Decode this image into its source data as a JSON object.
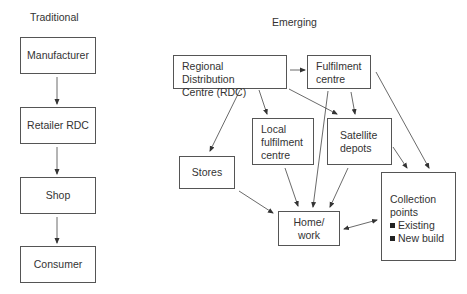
{
  "traditional": {
    "title": "Traditional",
    "boxes": [
      {
        "id": "manufacturer",
        "label": "Manufacturer"
      },
      {
        "id": "retailer-rdc",
        "label": "Retailer RDC"
      },
      {
        "id": "shop",
        "label": "Shop"
      },
      {
        "id": "consumer",
        "label": "Consumer"
      }
    ]
  },
  "emerging": {
    "title": "Emerging",
    "boxes": {
      "rdc": {
        "line1": "Regional Distribution",
        "line2": "Centre (RDC)"
      },
      "fulfilment": {
        "line1": "Fulfilment",
        "line2": "centre"
      },
      "local": {
        "line1": "Local",
        "line2": "fulfilment",
        "line3": "centre"
      },
      "satellite": {
        "line1": "Satellite",
        "line2": "depots"
      },
      "stores": {
        "label": "Stores"
      },
      "home": {
        "line1": "Home/",
        "line2": "work"
      },
      "collection": {
        "line1": "Collection",
        "line2": "points",
        "items": [
          "Existing",
          "New build"
        ]
      }
    },
    "edges": [
      {
        "from": "rdc",
        "to": "fulfilment"
      },
      {
        "from": "rdc",
        "to": "stores"
      },
      {
        "from": "rdc",
        "to": "local"
      },
      {
        "from": "rdc",
        "to": "satellite"
      },
      {
        "from": "fulfilment",
        "to": "satellite"
      },
      {
        "from": "fulfilment",
        "to": "home"
      },
      {
        "from": "fulfilment",
        "to": "collection"
      },
      {
        "from": "stores",
        "to": "home"
      },
      {
        "from": "local",
        "to": "home"
      },
      {
        "from": "satellite",
        "to": "home"
      },
      {
        "from": "satellite",
        "to": "collection"
      },
      {
        "from": "home",
        "to": "collection",
        "bidirectional": true
      }
    ]
  }
}
